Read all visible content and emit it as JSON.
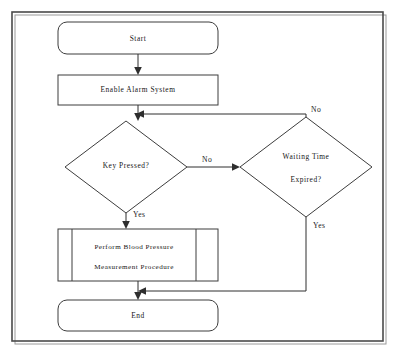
{
  "diagram": {
    "type": "flowchart",
    "background_color": "#ffffff",
    "line_color": "#2e2e2e",
    "text_color": "#161616",
    "frame": {
      "x": 12,
      "y": 12,
      "width": 371,
      "height": 329
    },
    "nodes": [
      {
        "id": "start",
        "shape": "terminator",
        "label": "Start",
        "lines": [
          "Start"
        ],
        "x": 58,
        "y": 22,
        "width": 160,
        "height": 32
      },
      {
        "id": "enable-alarm",
        "shape": "process",
        "label": "Enable Alarm System",
        "lines": [
          "Enable Alarm System"
        ],
        "x": 58,
        "y": 75,
        "width": 160,
        "height": 30
      },
      {
        "id": "key-pressed",
        "shape": "decision",
        "label": "Key Pressed?",
        "lines": [
          "Key Pressed?"
        ],
        "cx": 126,
        "cy": 167,
        "half_width": 61,
        "half_height": 46
      },
      {
        "id": "waiting-time-expired",
        "shape": "decision",
        "label": "Waiting Time Expired?",
        "lines": [
          "Waiting  Time",
          "Expired?"
        ],
        "cx": 306,
        "cy": 167,
        "half_width": 66,
        "half_height": 50
      },
      {
        "id": "measurement-procedure",
        "shape": "predefined-process",
        "label": "Perform Blood Pressure Measurement Procedure",
        "lines": [
          "Perform  Blood  Pressure",
          "Measurement Procedure"
        ],
        "x": 58,
        "y": 229,
        "width": 160,
        "height": 52
      },
      {
        "id": "end",
        "shape": "terminator",
        "label": "End",
        "lines": [
          "End"
        ],
        "x": 58,
        "y": 300,
        "width": 160,
        "height": 31
      }
    ],
    "edges": [
      {
        "id": "start-to-enable",
        "from": "start",
        "to": "enable-alarm",
        "label": ""
      },
      {
        "id": "enable-to-key",
        "from": "enable-alarm",
        "to": "key-pressed",
        "label": ""
      },
      {
        "id": "key-no-to-waiting",
        "from": "key-pressed",
        "to": "waiting-time-expired",
        "label": "No"
      },
      {
        "id": "key-yes-to-measure",
        "from": "key-pressed",
        "to": "measurement-procedure",
        "label": "Yes"
      },
      {
        "id": "waiting-no-loop-back",
        "from": "waiting-time-expired",
        "to": "key-pressed",
        "label": "No"
      },
      {
        "id": "waiting-yes-to-end",
        "from": "waiting-time-expired",
        "to": "end",
        "label": "Yes"
      },
      {
        "id": "measure-to-end",
        "from": "measurement-procedure",
        "to": "end",
        "label": ""
      }
    ],
    "edge_labels": {
      "key_no": "No",
      "key_yes": "Yes",
      "waiting_no": "No",
      "waiting_yes": "Yes"
    }
  }
}
